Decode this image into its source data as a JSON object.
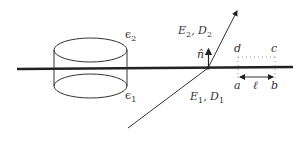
{
  "diagram": {
    "labels": {
      "eps_top": "ϵ",
      "eps_top_sub": "2",
      "eps_bottom": "ϵ",
      "eps_bottom_sub": "1",
      "field_top": "E",
      "field_top_sub": "2",
      "field_top_sep": ", D",
      "field_top_sub2": "2",
      "field_bottom": "E",
      "field_bottom_sub": "1",
      "field_bottom_sep": ", D",
      "field_bottom_sub2": "1",
      "normal": "n̂",
      "corner_d": "d",
      "corner_c": "c",
      "corner_a": "a",
      "corner_b": "b",
      "length": "ℓ"
    },
    "colors": {
      "line": "#222222",
      "dotted": "#999999",
      "text": "#333333"
    }
  }
}
